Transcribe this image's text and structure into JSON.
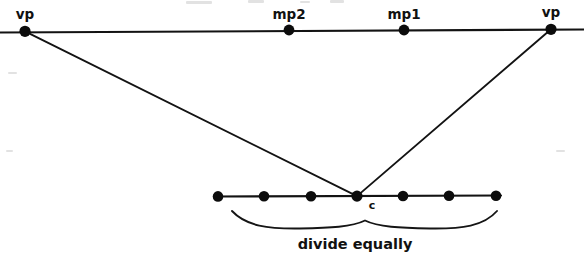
{
  "diagram": {
    "title": "divide equally",
    "type": "perspective-construction-diagram",
    "colors": {
      "line": "#131313",
      "dot": "#0c0c0c",
      "text": "#111111",
      "background": "#ffffff"
    },
    "horizon_line": {
      "name": "horizon-line",
      "x1": 0,
      "y1": 32.5,
      "x2": 584,
      "y2": 29.5
    },
    "measure_line": {
      "name": "measuring-line",
      "x1": 214,
      "y1": 196.5,
      "x2": 501,
      "y2": 195.5
    },
    "horizon_points": [
      {
        "id": "vp-left",
        "label": "vp",
        "x": 25,
        "y": 31.3,
        "label_x": 25,
        "label_y": 19,
        "r": 5.6
      },
      {
        "id": "mp2",
        "label": "mp2",
        "x": 289,
        "y": 30.0,
        "label_x": 289,
        "label_y": 19,
        "r": 5.4
      },
      {
        "id": "mp1",
        "label": "mp1",
        "x": 404,
        "y": 30.0,
        "label_x": 404,
        "label_y": 19,
        "r": 5.4
      },
      {
        "id": "vp-right",
        "label": "vp",
        "x": 551,
        "y": 29.3,
        "label_x": 551,
        "label_y": 17,
        "r": 5.6
      }
    ],
    "measure_points": [
      {
        "id": "mpt-1",
        "label": "",
        "x": 218,
        "y": 196.4,
        "r": 5.3
      },
      {
        "id": "mpt-2",
        "label": "",
        "x": 264,
        "y": 196.3,
        "r": 5.3
      },
      {
        "id": "mpt-3",
        "label": "",
        "x": 311,
        "y": 196.2,
        "r": 5.3
      },
      {
        "id": "center",
        "label": "c",
        "x": 357,
        "y": 196.1,
        "label_x": 372,
        "label_y": 208,
        "r": 5.6
      },
      {
        "id": "mpt-5",
        "label": "",
        "x": 403,
        "y": 196.0,
        "r": 5.3
      },
      {
        "id": "mpt-6",
        "label": "",
        "x": 449,
        "y": 195.8,
        "r": 5.3
      },
      {
        "id": "mpt-7",
        "label": "",
        "x": 496,
        "y": 195.7,
        "r": 5.3
      }
    ],
    "convergence_lines": [
      {
        "id": "line-vp-left-to-c",
        "x1": 25,
        "y1": 31.3,
        "x2": 357,
        "y2": 196.1
      },
      {
        "id": "line-vp-right-to-c",
        "x1": 551,
        "y1": 29.3,
        "x2": 357,
        "y2": 196.1
      }
    ],
    "brace": {
      "name": "divide-equally-brace",
      "left_x": 232,
      "right_x": 497,
      "center_x": 367,
      "top_y": 211,
      "bottom_y": 228,
      "notch_y": 221
    },
    "caption": {
      "text": "divide equally",
      "x": 355,
      "y": 248
    }
  }
}
